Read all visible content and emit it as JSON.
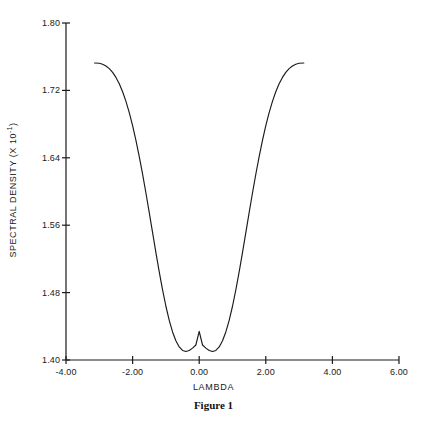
{
  "chart_data": {
    "type": "line",
    "title": "",
    "caption": "Figure 1",
    "xlabel": "LAMBDA",
    "ylabel": "SPECTRAL DENSITY (X 10",
    "ylabel_exponent": "-1",
    "ylabel_suffix": ")",
    "xlim": [
      -4.0,
      6.0
    ],
    "ylim": [
      1.4,
      1.8
    ],
    "xticks": [
      -4.0,
      -2.0,
      0.0,
      2.0,
      4.0,
      6.0
    ],
    "xtick_labels": [
      "-4.00",
      "-2.00",
      "0.00",
      "2.00",
      "4.00",
      "6.00"
    ],
    "yticks": [
      1.4,
      1.48,
      1.56,
      1.64,
      1.72,
      1.8
    ],
    "ytick_labels": [
      "1.40",
      "1.48",
      "1.56",
      "1.64",
      "1.72",
      "1.80"
    ],
    "grid": false,
    "legend": null,
    "line_color": "#1a1a1a",
    "axis_color": "#1a1a1a",
    "series": [
      {
        "name": "spectral density",
        "x": [
          -3.1416,
          -3.0,
          -2.9,
          -2.8,
          -2.7,
          -2.6,
          -2.5,
          -2.4,
          -2.3,
          -2.2,
          -2.1,
          -2.0,
          -1.9,
          -1.8,
          -1.7,
          -1.6,
          -1.5,
          -1.4,
          -1.3,
          -1.2,
          -1.1,
          -1.0,
          -0.9,
          -0.8,
          -0.7,
          -0.6,
          -0.5,
          -0.4,
          -0.3,
          -0.2,
          -0.1,
          0.0,
          0.1,
          0.2,
          0.3,
          0.4,
          0.5,
          0.6,
          0.7,
          0.8,
          0.9,
          1.0,
          1.1,
          1.2,
          1.3,
          1.4,
          1.5,
          1.6,
          1.7,
          1.8,
          1.9,
          2.0,
          2.1,
          2.2,
          2.3,
          2.4,
          2.5,
          2.6,
          2.7,
          2.8,
          2.9,
          3.0,
          3.1416
        ],
        "y": [
          1.7525,
          1.7522,
          1.751,
          1.749,
          1.7458,
          1.7414,
          1.7354,
          1.7278,
          1.7184,
          1.707,
          1.6936,
          1.6782,
          1.6608,
          1.6415,
          1.6205,
          1.5982,
          1.5749,
          1.5511,
          1.5275,
          1.5046,
          1.4832,
          1.4638,
          1.4471,
          1.4333,
          1.4228,
          1.4155,
          1.4113,
          1.41,
          1.4113,
          1.4141,
          1.4178,
          1.434,
          1.4178,
          1.4141,
          1.4113,
          1.41,
          1.4113,
          1.4155,
          1.4228,
          1.4333,
          1.4471,
          1.4638,
          1.4832,
          1.5046,
          1.5275,
          1.5511,
          1.5749,
          1.5982,
          1.6205,
          1.6415,
          1.6608,
          1.6782,
          1.6936,
          1.707,
          1.7184,
          1.7278,
          1.7354,
          1.7414,
          1.7458,
          1.749,
          1.751,
          1.7522,
          1.7525
        ],
        "y_min": 1.434,
        "y_min_at_x": 0.0,
        "x_start": -3.1416,
        "x_end": 3.1416,
        "y_at_endpoints": 1.7525
      }
    ]
  }
}
